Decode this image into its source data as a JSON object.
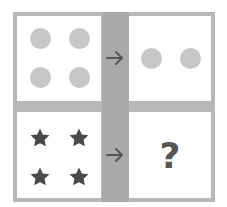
{
  "puzzle": {
    "colors": {
      "frame": "#b8b8b8",
      "column": "#a9a9a9",
      "panel_bg": "#ffffff",
      "circle": "#c6c6c6",
      "star": "#4a4a4a",
      "arrow": "#555555",
      "question_mark": "#555555"
    },
    "row1": {
      "left": {
        "shape": "circle",
        "count": 4
      },
      "arrow_icon": "arrow-right-icon",
      "right": {
        "shape": "circle",
        "count": 2
      }
    },
    "row2": {
      "left": {
        "shape": "star",
        "count": 4
      },
      "arrow_icon": "arrow-right-icon",
      "right": {
        "text": "?"
      }
    }
  }
}
